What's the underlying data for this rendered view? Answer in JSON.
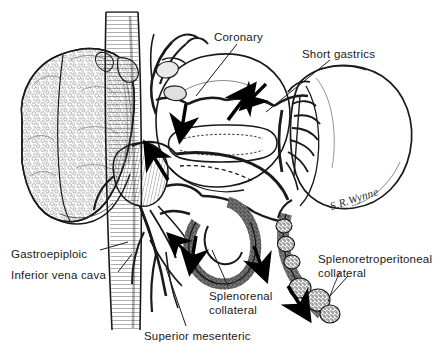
{
  "figure": {
    "background_color": "#ffffff",
    "ink_color": "#1a1a1a",
    "width": 436,
    "height": 358
  },
  "labels": [
    {
      "id": "coronary",
      "text": "Coronary",
      "x": 214,
      "y": 31
    },
    {
      "id": "short-gastrics",
      "text": "Short gastrics",
      "x": 302,
      "y": 48
    },
    {
      "id": "gastroepiploic",
      "text": "Gastroepiploic",
      "x": 11,
      "y": 248
    },
    {
      "id": "inferior-vena-cava",
      "text": "Inferior vena cava",
      "x": 11,
      "y": 269
    },
    {
      "id": "splenorenal-collateral",
      "text": "Splenorenal collateral",
      "x": 209,
      "y": 290
    },
    {
      "id": "splenoretroperitoneal-collateral",
      "text": "Splenoretroperitoneal collateral",
      "x": 318,
      "y": 253
    },
    {
      "id": "superior-mesenteric",
      "text": "Superior mesenteric",
      "x": 144,
      "y": 330
    }
  ],
  "signature": {
    "text": "S.R.Wynne",
    "x": 332,
    "y": 200
  },
  "anatomy": [
    {
      "id": "liver",
      "name": "liver-cirrhotic",
      "description": "Nodular cirrhotic liver, left of frame"
    },
    {
      "id": "inferior-vena-cava",
      "name": "inferior-vena-cava",
      "description": "Vertical hatched great vein"
    },
    {
      "id": "spleen",
      "name": "spleen",
      "description": "Enlarged spleen, right of frame"
    },
    {
      "id": "stomach",
      "name": "stomach",
      "description": "Outlined stomach body, upper centre"
    },
    {
      "id": "portal-vein",
      "name": "portal-vein",
      "description": "Portal venous confluence, centre"
    },
    {
      "id": "splenic-vein",
      "name": "splenic-vein",
      "description": "Splenic vein to splenic hilum"
    },
    {
      "id": "coronary-vein",
      "name": "coronary-vein",
      "description": "Left gastric / coronary vein with varices"
    },
    {
      "id": "short-gastric-veins",
      "name": "short-gastric-veins",
      "description": "Short gastric veins at splenic hilum"
    },
    {
      "id": "splenorenal-collateral",
      "name": "splenorenal-collateral",
      "description": "Stippled tortuous collateral loop"
    },
    {
      "id": "splenoretroperitoneal-collateral",
      "name": "splenoretroperitoneal-collateral",
      "description": "Beaded retroperitoneal collateral chain"
    },
    {
      "id": "gastroepiploic-vein",
      "name": "gastroepiploic-vein",
      "description": "Gastroepiploic vein, lower left"
    },
    {
      "id": "superior-mesenteric-vein",
      "name": "superior-mesenteric-vein",
      "description": "Superior mesenteric vein, lower centre"
    }
  ],
  "flow_arrows": [
    {
      "id": "arrow-coronary-up",
      "description": "Flow up into coronary vein"
    },
    {
      "id": "arrow-splenic-down",
      "description": "Flow down splenic vein"
    },
    {
      "id": "arrow-portal-up",
      "description": "Hepatopetal arrow at portal confluence"
    },
    {
      "id": "arrow-gastroepiploic",
      "description": "Flow along gastroepiploic route"
    },
    {
      "id": "arrow-splenorenal-left",
      "description": "Flow into splenorenal collateral"
    },
    {
      "id": "arrow-splenorenal-right",
      "description": "Flow out of splenorenal collateral"
    },
    {
      "id": "arrow-retroperitoneal",
      "description": "Flow down retroperitoneal collateral"
    }
  ]
}
